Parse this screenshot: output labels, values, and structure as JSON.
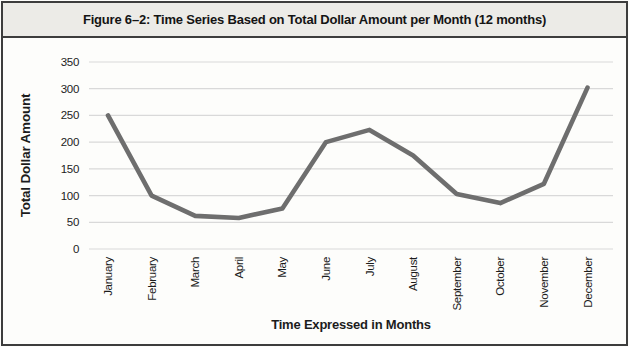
{
  "figure": {
    "title": "Figure 6–2: Time Series Based on Total Dollar Amount per Month (12 months)"
  },
  "chart_data": {
    "type": "line",
    "title": "Figure 6–2: Time Series Based on Total Dollar Amount per Month (12 months)",
    "xlabel": "Time Expressed in Months",
    "ylabel": "Total Dollar Amount",
    "categories": [
      "January",
      "February",
      "March",
      "April",
      "May",
      "June",
      "July",
      "August",
      "September",
      "October",
      "November",
      "December"
    ],
    "values": [
      250,
      100,
      62,
      58,
      76,
      200,
      223,
      175,
      103,
      86,
      122,
      302
    ],
    "ylim": [
      0,
      350
    ],
    "yticks": [
      0,
      50,
      100,
      150,
      200,
      250,
      300,
      350
    ],
    "grid": true,
    "legend": "none",
    "x_tick_rotation_deg": -90,
    "colors": {
      "line": "#6e6e6e",
      "gridline": "#d9d9d9",
      "text": "#1c1c1c",
      "title_band_bg": "#ecebe7",
      "frame_border": "#3d3d3d"
    }
  }
}
